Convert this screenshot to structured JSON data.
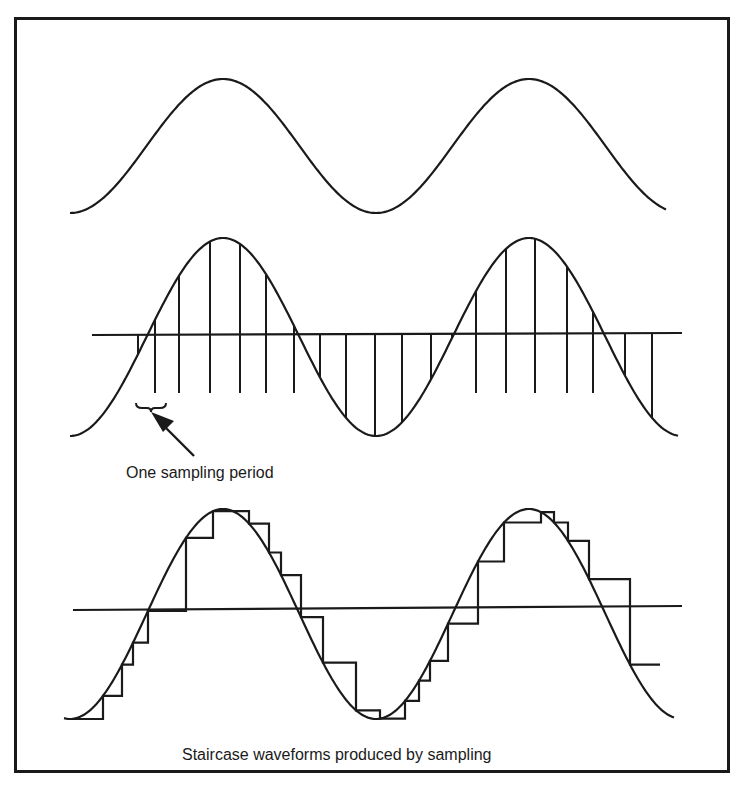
{
  "figure": {
    "caption": "Staircase waveforms produced by sampling",
    "annotation": "One sampling period",
    "colors": {
      "ink": "#1a1a1a",
      "background": "#ffffff"
    }
  },
  "panels": [
    {
      "name": "analog-signal",
      "description": "Continuous sine wave, two cycles"
    },
    {
      "name": "sampled-signal",
      "description": "Sine wave with vertical sample lines from the zero axis to the curve"
    },
    {
      "name": "staircase-signal",
      "description": "Sine wave with a sample-and-hold staircase approximation"
    }
  ],
  "geometry": {
    "x_start": 70,
    "x_end": 666,
    "period_px": 306,
    "phase_min_x": 70,
    "top": {
      "center_y": 146,
      "amp": 67
    },
    "mid": {
      "center_y": 337,
      "amp": 99,
      "axis_x1": 92,
      "axis_x2": 682,
      "stem_bottom": 393
    },
    "bottom": {
      "center_y": 614,
      "amp": 105,
      "axis_x1": 73,
      "axis_x2": 682
    },
    "sample_xs": [
      138,
      155,
      179,
      210,
      240,
      266,
      294,
      320,
      346,
      375,
      402,
      431,
      452,
      476,
      506,
      535,
      567,
      593,
      625,
      652
    ],
    "stair_xs": [
      70,
      103,
      122,
      133,
      148,
      186,
      213,
      249,
      269,
      281,
      301,
      323,
      356,
      380,
      405,
      419,
      430,
      448,
      478,
      504,
      541,
      554,
      568,
      589,
      630
    ]
  }
}
